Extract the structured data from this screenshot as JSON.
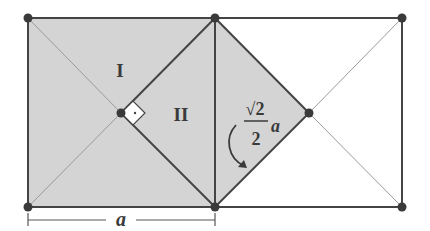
{
  "diagram": {
    "labels": {
      "region_1": "I",
      "region_2": "II",
      "side_length": "a",
      "half_diag_num": "√2",
      "half_diag_den": "2",
      "half_diag_var": "a",
      "right_angle_dot": "·"
    },
    "colors": {
      "shade": "#d4d4d4",
      "line": "#444444",
      "thin_line": "#9a9a9a",
      "point": "#3a3a3a"
    }
  }
}
